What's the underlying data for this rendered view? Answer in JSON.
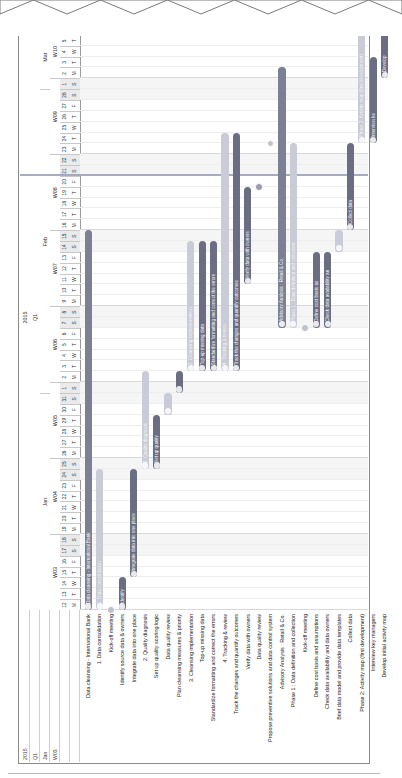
{
  "chart_data": {
    "type": "bar",
    "title": "Data cleansing - International Bank",
    "subtitle": "Gantt chart / project schedule",
    "xlabel": "",
    "ylabel": "",
    "orientation": "horizontal-gantt",
    "time_axis": {
      "year": "2015",
      "quarter": "Q1",
      "months": [
        "Jan",
        "Feb",
        "Mar"
      ],
      "weeks": [
        "W03",
        "W04",
        "W05",
        "W06",
        "W07",
        "W08",
        "W09",
        "W10"
      ],
      "start_day": 12,
      "start_month": "Jan",
      "end_day": 6,
      "end_month": "Mar",
      "day_numbers": [
        12,
        13,
        14,
        15,
        16,
        17,
        18,
        19,
        20,
        21,
        22,
        23,
        24,
        25,
        26,
        27,
        28,
        29,
        30,
        31,
        1,
        2,
        3,
        4,
        5,
        6,
        7,
        8,
        9,
        10,
        11,
        12,
        13,
        14,
        15,
        16,
        17,
        18,
        19,
        20,
        21,
        22,
        23,
        24,
        25,
        26,
        27,
        28,
        1,
        2,
        3,
        4,
        5,
        6
      ],
      "day_of_week": [
        "M",
        "T",
        "W",
        "T",
        "F",
        "S",
        "S",
        "M",
        "T",
        "W",
        "T",
        "F",
        "S",
        "S",
        "M",
        "T",
        "W",
        "T",
        "F",
        "S",
        "S",
        "M",
        "T",
        "W",
        "T",
        "F",
        "S",
        "S",
        "M",
        "T",
        "W",
        "T",
        "F",
        "S",
        "S",
        "M",
        "T",
        "W",
        "T",
        "F",
        "S",
        "S",
        "M",
        "T",
        "W",
        "T",
        "F",
        "S",
        "S",
        "M",
        "T",
        "W",
        "T",
        "F"
      ]
    },
    "categories": [
      "Data cleansing - International Bank",
      "1. Data consolidation",
      "Kick-off meeting",
      "Identify source data & owners",
      "Integrate data into one place",
      "2. Quality diagnosis",
      "Set up quality scoring logic",
      "Data quality review",
      "Plan cleansing measures & priority",
      "3. Cleansing implementation",
      "Top-up missing data",
      "Standardize formatting and correct the errors",
      "4. Tracking & review",
      "Track the changes and quantify outcomes",
      "Verify data with owners",
      "Data quality review",
      "Propose preventive solutions and data control system",
      "Advisory Analysis : Retail & Co.",
      "Phase 1 : Data definition and collection",
      "Kick-off meeting",
      "Define cost basis and assumptions",
      "Check data availability and data owners",
      "Brief data model and provide data templates",
      "Collect data",
      "Phase 2: Activity map (first development)",
      "Interview key managers",
      "Develop initial activity map"
    ],
    "tasks": [
      {
        "name": "Data cleansing - International Bank",
        "label": "Data cleansing - International Bank",
        "type": "summary",
        "start_day": 0,
        "duration": 35,
        "color": "#7d7f93",
        "indent": 0
      },
      {
        "name": "1. Data consolidation",
        "label": "1. Data consolidation",
        "type": "summary",
        "start_day": 0,
        "duration": 13,
        "color": "#c9cbd6",
        "indent": 1
      },
      {
        "name": "Kick-off meeting",
        "label": "",
        "type": "milestone",
        "start_day": 0,
        "duration": 0,
        "color": "#c0c2cc",
        "indent": 2
      },
      {
        "name": "Identify source data & owners",
        "label": "Identify",
        "type": "task",
        "start_day": 0,
        "duration": 3,
        "color": "#6b6d82",
        "indent": 2
      },
      {
        "name": "Integrate data into one place",
        "label": "Integrate data into one place",
        "type": "task",
        "start_day": 3,
        "duration": 10,
        "color": "#6b6d82",
        "indent": 2
      },
      {
        "name": "2. Quality diagnosis",
        "label": "2. Quality diagnosis",
        "type": "summary",
        "start_day": 13,
        "duration": 9,
        "color": "#c9cbd6",
        "indent": 1
      },
      {
        "name": "Set up quality scoring logic",
        "label": "Set up quality",
        "type": "task",
        "start_day": 13,
        "duration": 5,
        "color": "#6b6d82",
        "indent": 2
      },
      {
        "name": "Data quality review",
        "label": "",
        "type": "task",
        "start_day": 18,
        "duration": 2,
        "color": "#c9cbd6",
        "indent": 2
      },
      {
        "name": "Plan cleansing measures & priority",
        "label": "",
        "type": "task",
        "start_day": 20,
        "duration": 2,
        "color": "#6b6d82",
        "indent": 2
      },
      {
        "name": "3. Cleansing implementation",
        "label": "3. Cleansing implementation",
        "type": "summary",
        "start_day": 22,
        "duration": 12,
        "color": "#c9cbd6",
        "indent": 1
      },
      {
        "name": "Top-up missing data",
        "label": "Top-up missing data",
        "type": "task",
        "start_day": 22,
        "duration": 12,
        "color": "#6b6d82",
        "indent": 2
      },
      {
        "name": "Standardize formatting and correct the errors",
        "label": "Standardize formatting and correct the errors",
        "type": "task",
        "start_day": 22,
        "duration": 12,
        "color": "#6b6d82",
        "indent": 2
      },
      {
        "name": "4. Tracking & review",
        "label": "4. Tracking & review",
        "type": "summary",
        "start_day": 22,
        "duration": 22,
        "color": "#c9cbd6",
        "indent": 1
      },
      {
        "name": "Track the changes and quantify outcomes",
        "label": "Track the changes and quantify outcomes",
        "type": "task",
        "start_day": 22,
        "duration": 22,
        "color": "#6b6d82",
        "indent": 2
      },
      {
        "name": "Verify data with owners",
        "label": "Verify data with owners",
        "type": "task",
        "start_day": 30,
        "duration": 9,
        "color": "#6b6d82",
        "indent": 2
      },
      {
        "name": "Data quality review",
        "label": "",
        "type": "milestone",
        "start_day": 39,
        "duration": 0,
        "color": "#9a9cae",
        "indent": 2
      },
      {
        "name": "Propose preventive solutions and data control system",
        "label": "",
        "type": "milestone",
        "start_day": 43,
        "duration": 0,
        "color": "#c0c2cc",
        "indent": 2
      },
      {
        "name": "Advisory Analysis : Retail & Co.",
        "label": "Advisory Analysis : Retail & Co.",
        "type": "summary",
        "start_day": 26,
        "duration": 24,
        "color": "#7d7f93",
        "indent": 0
      },
      {
        "name": "Phase 1 : Data definition and collection",
        "label": "Phase 1 : Data definition and collection",
        "type": "summary",
        "start_day": 26,
        "duration": 17,
        "color": "#c9cbd6",
        "indent": 1
      },
      {
        "name": "Kick-off meeting",
        "label": "",
        "type": "milestone",
        "start_day": 26,
        "duration": 0,
        "color": "#c0c2cc",
        "indent": 2
      },
      {
        "name": "Define cost basis and assumptions",
        "label": "Define cost basis as",
        "type": "task",
        "start_day": 26,
        "duration": 7,
        "color": "#6b6d82",
        "indent": 2
      },
      {
        "name": "Check data availability and data owners",
        "label": "Check data availability an",
        "type": "task",
        "start_day": 26,
        "duration": 7,
        "color": "#6b6d82",
        "indent": 2
      },
      {
        "name": "Brief data model and provide data templates",
        "label": "",
        "type": "task",
        "start_day": 33,
        "duration": 2,
        "color": "#c9cbd6",
        "indent": 2
      },
      {
        "name": "Collect data",
        "label": "Collect data",
        "type": "task",
        "start_day": 35,
        "duration": 8,
        "color": "#6b6d82",
        "indent": 2
      },
      {
        "name": "Phase 2: Activity map (first development)",
        "label": "Phase 2: Activity map (first development)",
        "type": "summary",
        "start_day": 43,
        "duration": 11,
        "color": "#c9cbd6",
        "indent": 1
      },
      {
        "name": "Interview key managers",
        "label": "Interview ke",
        "type": "task",
        "start_day": 43,
        "duration": 8,
        "color": "#6b6d82",
        "indent": 2
      },
      {
        "name": "Develop initial activity map",
        "label": "Develop",
        "type": "task",
        "start_day": 49,
        "duration": 5,
        "color": "#6b6d82",
        "indent": 2
      }
    ],
    "today_marker_day": 40,
    "legend": [],
    "colors": {
      "project_bar": "#7d7f93",
      "summary_bar": "#c9cbd6",
      "task_bar": "#6b6d82",
      "milestone": "#c0c2cc",
      "today_line": "#9aa0b4",
      "grid": "#eeeeee",
      "weekend": "#f5f5f5",
      "border": "#8b8b8b"
    }
  },
  "header_rows": {
    "year": "2015",
    "quarter": "Q1",
    "month": "Jan",
    "week": "W03"
  }
}
